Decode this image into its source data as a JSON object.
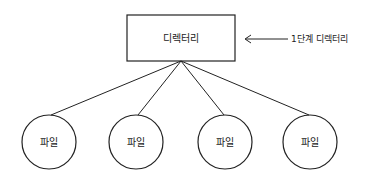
{
  "diagram": {
    "root": {
      "label": "디렉터리"
    },
    "annotation": {
      "label": "1단계 디렉터리",
      "arrow": "left"
    },
    "children": [
      {
        "label": "파일"
      },
      {
        "label": "파일"
      },
      {
        "label": "파일"
      },
      {
        "label": "파일"
      }
    ],
    "colors": {
      "stroke": "#222222",
      "background": "#ffffff"
    }
  }
}
